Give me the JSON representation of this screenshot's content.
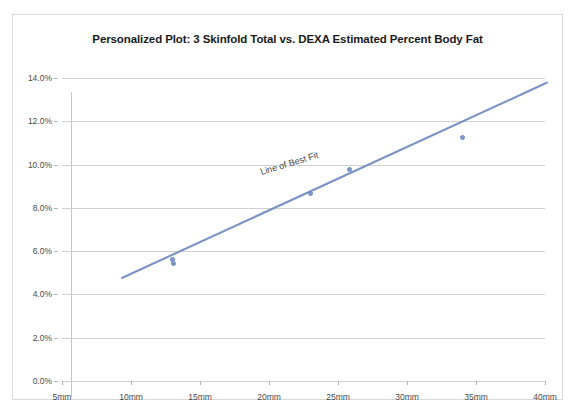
{
  "chart_data": {
    "type": "scatter",
    "title": "Personalized Plot: 3 Skinfold Total vs. DEXA Estimated Percent Body Fat",
    "xlabel": "",
    "ylabel": "",
    "xlim": [
      5,
      40
    ],
    "ylim": [
      0,
      14
    ],
    "grid": true,
    "legend": "none",
    "x_tick_labels": [
      "5mm",
      "10mm",
      "15mm",
      "20mm",
      "25mm",
      "30mm",
      "35mm",
      "40mm"
    ],
    "x_ticks": [
      5,
      10,
      15,
      20,
      25,
      30,
      35,
      40
    ],
    "y_tick_labels": [
      "0.0%",
      "2.0%",
      "4.0%",
      "6.0%",
      "8.0%",
      "10.0%",
      "12.0%",
      "14.0%"
    ],
    "y_ticks": [
      0,
      2,
      4,
      6,
      8,
      10,
      12,
      14
    ],
    "series": [
      {
        "name": "3 Skinfold Total vs. DEXA Percent Body Fat",
        "marker_color": "#8098c8",
        "points": [
          {
            "x": 13.0,
            "y": 5.6
          },
          {
            "x": 13.1,
            "y": 5.45
          },
          {
            "x": 23.0,
            "y": 8.65
          },
          {
            "x": 25.8,
            "y": 9.75
          },
          {
            "x": 34.0,
            "y": 11.25
          }
        ]
      }
    ],
    "trendline": {
      "label": "Line of Best Fit",
      "color": "#7a92c4",
      "x_start": 9.3,
      "y_start": 4.75,
      "x_end": 40.2,
      "y_end": 13.8
    },
    "annotations": [
      {
        "text": "Line of Best Fit",
        "x": 19.5,
        "y": 9.9,
        "rotation_deg": -17
      }
    ]
  },
  "colors": {
    "trendline": "#7a92c4",
    "marker": "#8098c8",
    "gridline": "#d0d0d0",
    "frame_border": "#d9d9d9",
    "title_text": "#1a1a1a",
    "axis_text": "#4a4a4a"
  }
}
